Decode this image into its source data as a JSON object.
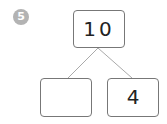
{
  "problem": {
    "number": "5",
    "badge_color": "#b3b3b3"
  },
  "number_bond": {
    "whole": "10",
    "parts": [
      "",
      "4"
    ]
  }
}
